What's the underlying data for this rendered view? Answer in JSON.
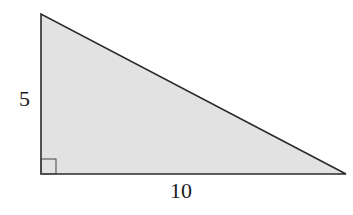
{
  "diagram": {
    "type": "right-triangle",
    "fill_color": "#e2e2e2",
    "stroke_color": "#2a2a2a",
    "vertices": {
      "top": [
        41,
        14
      ],
      "right_angle": [
        41,
        174
      ],
      "right": [
        346,
        174
      ]
    },
    "labels": {
      "vertical_leg": "5",
      "horizontal_leg": "10"
    },
    "right_angle_marker": true
  }
}
